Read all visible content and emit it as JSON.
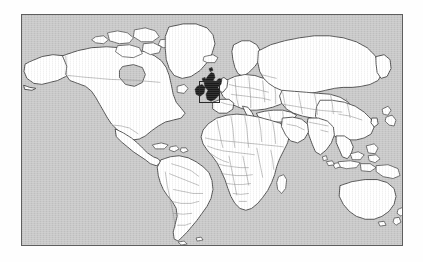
{
  "page": {
    "background_color": "#fefefe",
    "width": 423,
    "height": 262
  },
  "map": {
    "title": "World map with locator box",
    "projection": "equirectangular",
    "frame": {
      "x": 21,
      "y": 14,
      "width": 382,
      "height": 232,
      "border_color": "#5e5e5e",
      "border_width": 1.4
    },
    "colors": {
      "ocean": "#c9c9c9",
      "land": "#ffffff",
      "coastline": "#3a3a3a",
      "country_border": "#7d7d7d",
      "highlight_fill": "#1a1a1a",
      "locator_box_border": "#2b2b2b"
    },
    "locator_box": {
      "label": "locator-highlight-box",
      "region_name": "British Isles",
      "x": 199,
      "y": 81,
      "width": 21,
      "height": 22,
      "border_color": "#2b2b2b",
      "border_width": 1.6
    },
    "continents": [
      "North America",
      "South America",
      "Europe",
      "Africa",
      "Asia",
      "Australia",
      "Greenland",
      "Antarctica"
    ],
    "features": [
      "country borders",
      "coastlines",
      "major islands"
    ]
  }
}
